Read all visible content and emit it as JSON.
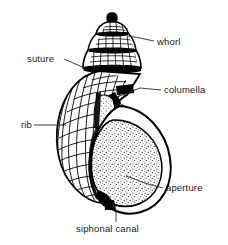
{
  "figure": {
    "style": "black and white line drawing",
    "background_color": "#ffffff",
    "ink_color": "#000000",
    "text_color": "#1a1a1a"
  },
  "labels": [
    {
      "id": "whorl",
      "text": "whorl",
      "text_x": 157,
      "text_y": 45,
      "anchor": "start",
      "leader": "M 154 41 L 140 38 L 128 36",
      "side": "right"
    },
    {
      "id": "suture",
      "text": "suture",
      "text_x": 27,
      "text_y": 62,
      "anchor": "start",
      "leader": "M 64 59 L 80 66 L 88 70",
      "side": "left"
    },
    {
      "id": "columella",
      "text": "columella",
      "text_x": 164,
      "text_y": 93,
      "anchor": "start",
      "leader": "M 161 90 L 140 88 L 112 99",
      "side": "right"
    },
    {
      "id": "rib",
      "text": "rib",
      "text_x": 21,
      "text_y": 128,
      "anchor": "start",
      "leader": "M 34 125 L 52 125 L 66 125",
      "side": "left"
    },
    {
      "id": "aperture",
      "text": "aperture",
      "text_x": 166,
      "text_y": 191,
      "anchor": "start",
      "leader": "M 163 188 L 148 184 L 126 176",
      "side": "right"
    },
    {
      "id": "siphonal-canal",
      "text": "siphonal canal",
      "text_x": 76,
      "text_y": 232,
      "anchor": "start",
      "leader": "M 116 222 L 116 210 L 112 202",
      "side": "bottom"
    }
  ],
  "shell_parts": {
    "spire": "tall conical spire with stepped whorls",
    "body_whorl": "large rounded body whorl",
    "aperture": "large oval opening with stippled interior",
    "siphonal_canal": "short notch at the base",
    "sculpture": "axial ribs crossed by spiral cords forming a grid"
  }
}
